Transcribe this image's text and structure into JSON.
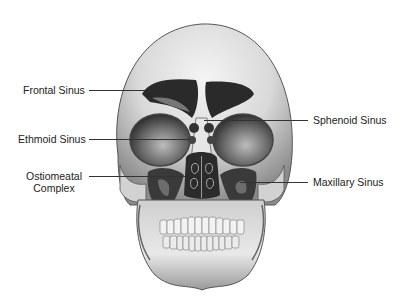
{
  "figure": {
    "labels": {
      "frontal": "Frontal Sinus",
      "ethmoid": "Ethmoid Sinus",
      "ostiomeatal_line1": "Ostiomeatal",
      "ostiomeatal_line2": "Complex",
      "sphenoid": "Sphenoid Sinus",
      "maxillary": "Maxillary Sinus"
    }
  }
}
